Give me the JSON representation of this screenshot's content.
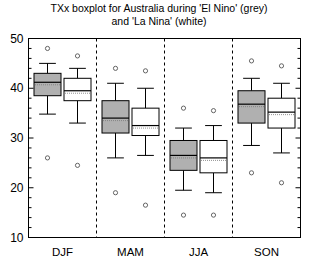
{
  "chart_data": {
    "type": "boxplot",
    "title": "TXx boxplot for Australia during 'El Nino' (grey) and 'La Nina' (white)",
    "title_line1": "TXx boxplot for Australia during 'El Nino' (grey)",
    "title_line2": "and 'La Nina' (white)",
    "xlabel": "",
    "ylabel": "",
    "categories": [
      "DJF",
      "MAM",
      "JJA",
      "SON"
    ],
    "ylim": [
      10,
      50
    ],
    "ytick_labels": [
      "10",
      "20",
      "30",
      "40",
      "50"
    ],
    "ytick_values": [
      10,
      20,
      30,
      40,
      50
    ],
    "yminor_step": 2,
    "grid": false,
    "legend": "encoded in title: grey = El Nino, white = La Nina",
    "series": [
      {
        "name": "El Nino",
        "fill": "#b0b0b0",
        "boxes": [
          {
            "category": "DJF",
            "whisker_low": 34.8,
            "q1": 38.5,
            "median": 41.2,
            "q3": 43.0,
            "whisker_high": 45.0,
            "outliers": [
              48.0,
              26.0
            ]
          },
          {
            "category": "MAM",
            "whisker_low": 26.0,
            "q1": 31.0,
            "median": 34.0,
            "q3": 37.5,
            "whisker_high": 41.0,
            "outliers": [
              44.0,
              19.0
            ]
          },
          {
            "category": "JJA",
            "whisker_low": 19.5,
            "q1": 23.5,
            "median": 26.5,
            "q3": 29.5,
            "whisker_high": 32.0,
            "outliers": [
              36.0,
              14.5
            ]
          },
          {
            "category": "SON",
            "whisker_low": 28.5,
            "q1": 33.0,
            "median": 36.8,
            "q3": 39.5,
            "whisker_high": 42.0,
            "outliers": [
              45.5,
              23.0
            ]
          }
        ]
      },
      {
        "name": "La Nina",
        "fill": "#ffffff",
        "boxes": [
          {
            "category": "DJF",
            "whisker_low": 33.0,
            "q1": 37.5,
            "median": 39.5,
            "q3": 42.0,
            "whisker_high": 44.0,
            "outliers": [
              46.5,
              24.5
            ]
          },
          {
            "category": "MAM",
            "whisker_low": 26.5,
            "q1": 30.5,
            "median": 32.5,
            "q3": 36.0,
            "whisker_high": 40.0,
            "outliers": [
              43.5,
              16.5
            ]
          },
          {
            "category": "JJA",
            "whisker_low": 19.0,
            "q1": 23.0,
            "median": 26.0,
            "q3": 29.5,
            "whisker_high": 32.5,
            "outliers": [
              35.5,
              14.5
            ]
          },
          {
            "category": "SON",
            "whisker_low": 27.0,
            "q1": 32.0,
            "median": 35.2,
            "q3": 38.0,
            "whisker_high": 41.0,
            "outliers": [
              44.5,
              21.0
            ]
          }
        ]
      }
    ],
    "separators_after": [
      "DJF",
      "MAM",
      "JJA"
    ],
    "colors": {
      "el_nino_fill": "#b0b0b0",
      "la_nina_fill": "#ffffff",
      "line": "#000000",
      "separator": "#000000",
      "background": "#ffffff"
    }
  }
}
